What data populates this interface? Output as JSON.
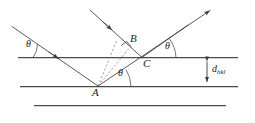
{
  "figure": {
    "name": "bragg-diffraction-diagram",
    "type": "diagram",
    "background": "#ffffff",
    "stroke_color": "#3a3a3a",
    "text_color": "#1a1a1a",
    "width": 255,
    "height": 123
  },
  "labels": {
    "point_A": "A",
    "point_B": "B",
    "point_C": "C",
    "theta_incident_left": "θ",
    "theta_at_C": "θ",
    "theta_at_A": "θ",
    "d_spacing_main": "d",
    "d_spacing_sub": "hkl"
  },
  "geometry": {
    "planes": [
      {
        "name": "top-lattice-plane",
        "x1": 18,
        "y1": 57,
        "x2": 238,
        "y2": 57
      },
      {
        "name": "middle-lattice-plane",
        "x1": 20,
        "y1": 86,
        "x2": 238,
        "y2": 86
      },
      {
        "name": "bottom-lattice-plane",
        "x1": 34,
        "y1": 105,
        "x2": 226,
        "y2": 105
      }
    ],
    "rays": [
      {
        "name": "incident-ray-1",
        "x1": 12,
        "y1": 27,
        "x2": 98,
        "y2": 86,
        "arrow_at": 0.62
      },
      {
        "name": "incident-ray-2",
        "x1": 90,
        "y1": 10,
        "x2": 142,
        "y2": 57,
        "arrow_at": 0.52
      },
      {
        "name": "reflected-ray-1",
        "x1": 98,
        "y1": 86,
        "x2": 212,
        "y2": 9,
        "arrow_at": 1.0
      },
      {
        "name": "reflected-ray-2",
        "x1": 142,
        "y1": 57,
        "x2": 186,
        "y2": 27,
        "arrow_at": 0.0
      }
    ],
    "dashed": [
      {
        "name": "dashed-A-to-B",
        "x1": 98,
        "y1": 86,
        "x2": 129,
        "y2": 48
      },
      {
        "name": "dashed-A-upper-left",
        "x1": 98,
        "y1": 86,
        "x2": 116,
        "y2": 41
      }
    ],
    "right_angle": {
      "name": "right-angle-mark-at-B",
      "x": 124,
      "y": 49,
      "size": 7
    },
    "d_arrow": {
      "name": "d-spacing-double-arrow",
      "x": 207,
      "y1": 58,
      "y2": 85
    }
  },
  "label_positions": {
    "point_A": {
      "x": 93,
      "y": 89
    },
    "point_B": {
      "x": 131,
      "y": 35
    },
    "point_C": {
      "x": 144,
      "y": 59
    },
    "theta_incident_left": {
      "x": 27,
      "y": 41
    },
    "theta_at_C": {
      "x": 167,
      "y": 43
    },
    "theta_at_A": {
      "x": 119,
      "y": 70
    },
    "d_spacing": {
      "x": 213,
      "y": 65
    }
  },
  "arcs": [
    {
      "name": "arc-theta-left",
      "cx": 55,
      "cy": 57,
      "r": 20,
      "a1": 180,
      "a2": 214
    },
    {
      "name": "arc-theta-C",
      "cx": 142,
      "cy": 57,
      "r": 28,
      "a1": 145,
      "a2": 180
    },
    {
      "name": "arc-theta-A",
      "cx": 98,
      "cy": 86,
      "r": 26,
      "a1": 325,
      "a2": 360
    }
  ]
}
